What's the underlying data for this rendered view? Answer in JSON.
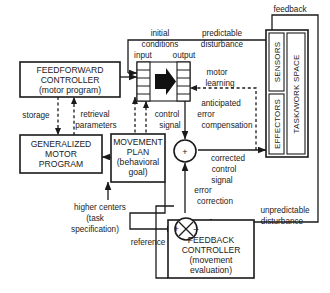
{
  "diagram": {
    "blocks": {
      "feedforward_controller": {
        "line1": "FEEDFORWARD",
        "line2": "CONTROLLER",
        "line3": "(motor  program)"
      },
      "generalized_motor_program": {
        "line1": "GENERALIZED",
        "line2": "MOTOR",
        "line3": "PROGRAM"
      },
      "movement_plan": {
        "line1": "MOVEMENT",
        "line2": "PLAN",
        "line3": "(behavioral",
        "line4": "goal)"
      },
      "feedback_controller": {
        "line1": "FEEDBACK",
        "line2": "CONTROLLER",
        "line3": "(movement",
        "line4": "evaluation)"
      },
      "plant": {
        "input": "input",
        "output": "output",
        "sensors": "SENSORS",
        "effectors": "EFFECTORS",
        "taskspace": "TASK/WORK SPACE"
      }
    },
    "signals": {
      "initial_conditions_1": "initial",
      "initial_conditions_2": "conditions",
      "predictable_disturbance_1": "predictable",
      "predictable_disturbance_2": "disturbance",
      "feedback": "feedback",
      "motor_learning_1": "motor",
      "motor_learning_2": "learning",
      "storage": "storage",
      "retrieval_1": "retrieval",
      "retrieval_2": "parameters",
      "control_signal_1": "control",
      "control_signal_2": "signal",
      "anticipated_error_1": "anticipated",
      "anticipated_error_2": "error",
      "anticipated_error_3": "compensation",
      "corrected_1": "corrected",
      "corrected_2": "control",
      "corrected_3": "signal",
      "error_correction_1": "error",
      "error_correction_2": "correction",
      "higher_centers_1": "higher  centers",
      "higher_centers_2": "(task",
      "higher_centers_3": "specification)",
      "reference": "reference",
      "unpredictable_1": "unpredictable",
      "unpredictable_2": "disturbance"
    },
    "junctions": {
      "sum_plus": "+",
      "compare_plus": "+",
      "compare_minus": "–"
    },
    "colors": {
      "ink": "#1a1a1a",
      "paper": "#ffffff"
    }
  }
}
